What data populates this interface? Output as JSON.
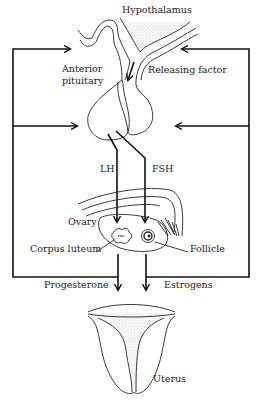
{
  "diagram": {
    "type": "hormonal regulation of the female reproductive cycle",
    "labels": {
      "hypothalamus": "Hypothalamus",
      "anterior_pituitary_line1": "Anterior",
      "anterior_pituitary_line2": "pituitary",
      "releasing_factor": "Releasing factor",
      "lh": "LH",
      "fsh": "FSH",
      "ovary": "Ovary",
      "corpus_luteum": "Corpus luteum",
      "follicle": "Follicle",
      "progesterone": "Progesterone",
      "estrogens": "Estrogens",
      "uterus": "Uterus"
    },
    "nodes": [
      "Hypothalamus",
      "Anterior pituitary",
      "Ovary",
      "Corpus luteum",
      "Follicle",
      "Uterus"
    ],
    "edges": [
      {
        "from": "Hypothalamus",
        "to": "Anterior pituitary",
        "label": "Releasing factor"
      },
      {
        "from": "Anterior pituitary",
        "to": "Corpus luteum",
        "label": "LH"
      },
      {
        "from": "Anterior pituitary",
        "to": "Follicle",
        "label": "FSH"
      },
      {
        "from": "Corpus luteum",
        "to": "Uterus",
        "label": "Progesterone"
      },
      {
        "from": "Follicle",
        "to": "Uterus",
        "label": "Estrogens"
      },
      {
        "from": "Progesterone",
        "to": "Hypothalamus",
        "label": "feedback"
      },
      {
        "from": "Progesterone",
        "to": "Anterior pituitary",
        "label": "feedback"
      },
      {
        "from": "Estrogens",
        "to": "Hypothalamus",
        "label": "feedback"
      },
      {
        "from": "Estrogens",
        "to": "Anterior pituitary",
        "label": "feedback"
      }
    ],
    "colors": {
      "ink": "#111111",
      "background": "#ffffff",
      "stipple": "#9a9a9a"
    }
  }
}
